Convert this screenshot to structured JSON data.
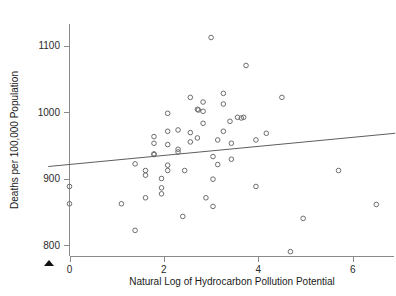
{
  "chart_data": {
    "type": "scatter",
    "title": "",
    "xlabel": "Natural Log of Hydrocarbon Pollution Potential",
    "ylabel": "Deaths per 100,000 Population",
    "xlim": [
      -0.45,
      6.9
    ],
    "ylim": [
      775,
      1125
    ],
    "grid": false,
    "legend": null,
    "xticks": [
      0,
      2,
      4,
      6
    ],
    "xtick_labels": [
      "0",
      "2",
      "4",
      "6"
    ],
    "yticks": [
      800,
      900,
      1000,
      1100
    ],
    "ytick_labels": [
      "800",
      "900",
      "1000",
      "1100"
    ],
    "marker": "open-circle",
    "series": [
      {
        "name": "cities",
        "points": [
          [
            0.0,
            888
          ],
          [
            0.0,
            862
          ],
          [
            1.1,
            862
          ],
          [
            1.39,
            822
          ],
          [
            1.39,
            922
          ],
          [
            1.61,
            912
          ],
          [
            1.61,
            905
          ],
          [
            1.61,
            871
          ],
          [
            1.79,
            963
          ],
          [
            1.79,
            953
          ],
          [
            1.79,
            936
          ],
          [
            1.79,
            937
          ],
          [
            1.95,
            900
          ],
          [
            1.95,
            886
          ],
          [
            1.95,
            877
          ],
          [
            2.08,
            998
          ],
          [
            2.08,
            971
          ],
          [
            2.08,
            951
          ],
          [
            2.08,
            920
          ],
          [
            2.08,
            912
          ],
          [
            2.3,
            973
          ],
          [
            2.3,
            944
          ],
          [
            2.3,
            940
          ],
          [
            2.4,
            843
          ],
          [
            2.44,
            912
          ],
          [
            2.56,
            1022
          ],
          [
            2.56,
            969
          ],
          [
            2.56,
            955
          ],
          [
            2.71,
            1004
          ],
          [
            2.73,
            1003
          ],
          [
            2.71,
            961
          ],
          [
            2.83,
            1015
          ],
          [
            2.83,
            983
          ],
          [
            2.83,
            1001
          ],
          [
            2.89,
            871
          ],
          [
            3.0,
            1112
          ],
          [
            3.04,
            933
          ],
          [
            3.04,
            899
          ],
          [
            3.04,
            858
          ],
          [
            3.14,
            958
          ],
          [
            3.14,
            921
          ],
          [
            3.26,
            1028
          ],
          [
            3.26,
            1012
          ],
          [
            3.26,
            971
          ],
          [
            3.4,
            986
          ],
          [
            3.43,
            953
          ],
          [
            3.43,
            929
          ],
          [
            3.56,
            992
          ],
          [
            3.64,
            991
          ],
          [
            3.69,
            992
          ],
          [
            3.74,
            1070
          ],
          [
            3.95,
            888
          ],
          [
            3.95,
            958
          ],
          [
            4.17,
            968
          ],
          [
            4.5,
            1022
          ],
          [
            4.68,
            790
          ],
          [
            4.95,
            840
          ],
          [
            5.7,
            912
          ],
          [
            6.5,
            861
          ]
        ]
      }
    ],
    "fit_line": {
      "type": "linear-regression",
      "x_start": -0.45,
      "y_start": 918,
      "x_end": 6.9,
      "y_end": 968
    }
  },
  "axis": {
    "y_title": "Deaths per 100,000 Population",
    "x_title": "Natural Log of Hydrocarbon Pollution Potential"
  },
  "markers": {
    "caret": "caret-up-marker"
  }
}
